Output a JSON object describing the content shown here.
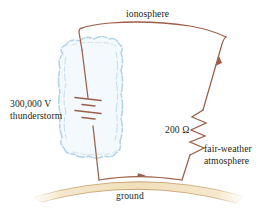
{
  "figure": {
    "background_color": "#ffffff",
    "labels": {
      "ionosphere": "ionosphere",
      "voltage": "300,000 V",
      "source": "thunderstorm",
      "resistance": "200 Ω",
      "load_line1": "fair-weather",
      "load_line2": "atmosphere",
      "ground": "ground"
    },
    "colors": {
      "wire": "#9c5f49",
      "cloud_outline": "#b9d6e6",
      "cloud_fill": "#eef6fa",
      "ground_fill": "#f2e0bd",
      "ground_outline": "#c8a978",
      "text": "#231f20"
    },
    "components": [
      {
        "name": "battery",
        "symbol": "voltage-source",
        "label": "300,000 V",
        "sublabel": "thunderstorm"
      },
      {
        "name": "resistor",
        "symbol": "zigzag",
        "label": "200 Ω",
        "sublabel": "fair-weather atmosphere"
      },
      {
        "name": "ionosphere-conductor",
        "symbol": "wire",
        "label": "ionosphere"
      },
      {
        "name": "ground-conductor",
        "symbol": "earth-arc",
        "label": "ground"
      }
    ],
    "current_arrows": 2
  }
}
